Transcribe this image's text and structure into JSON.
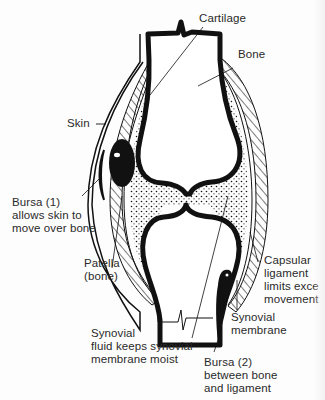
{
  "diagram": {
    "colors": {
      "ink": "#111111",
      "label_text": "#2a2a2a",
      "background": "#fdfdfd"
    },
    "labels": {
      "cartilage": {
        "lines": [
          "Cartilage"
        ]
      },
      "bone": {
        "lines": [
          "Bone"
        ]
      },
      "skin": {
        "lines": [
          "Skin"
        ]
      },
      "bursa1": {
        "lines": [
          "Bursa (1)",
          "allows skin to",
          "move over bone"
        ]
      },
      "patella": {
        "lines": [
          "Patella",
          "(bone)"
        ]
      },
      "capsular_ligament": {
        "lines": [
          "Capsular",
          "ligament",
          "limits exce",
          "movement"
        ]
      },
      "synovial_membrane": {
        "lines": [
          "Synovial",
          "membrane"
        ]
      },
      "synovial_fluid": {
        "lines": [
          "Synovial",
          "fluid keeps synovial",
          "membrane moist"
        ]
      },
      "bursa2": {
        "lines": [
          "Bursa (2)",
          "between bone",
          "and ligament"
        ]
      }
    },
    "structures": [
      "femur-bone",
      "tibia-bone",
      "articular-cartilage",
      "joint-cavity-synovial-fluid",
      "patella",
      "bursa-1",
      "bursa-2",
      "skin",
      "capsular-ligament",
      "synovial-membrane"
    ]
  }
}
